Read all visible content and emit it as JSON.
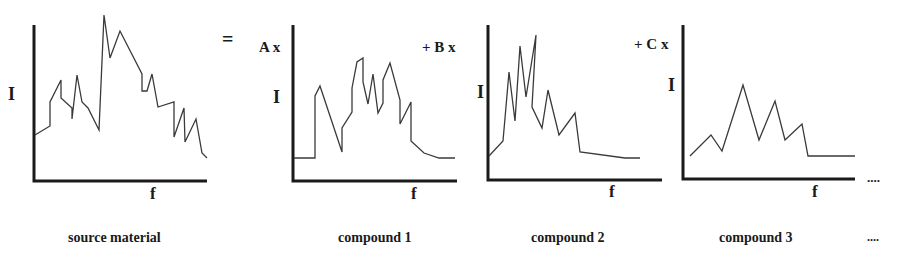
{
  "diagram": {
    "equation": {
      "equals": "=",
      "coef_a": "A x",
      "coef_b": "+ B x",
      "coef_c": "+ C x",
      "ellipsis": "...."
    },
    "panels": [
      {
        "id": "source",
        "caption": "source material",
        "y_label": "I",
        "x_label": "f",
        "points": "35,135 50,126 50,102 61,80 61,98 72,108 72,119 77,75 82,102 88,108 99,130 104,15 110,58 120,31 142,74 142,91 147,91 152,74 158,107 174,102 174,137 184,108 185,142 196,119 202,153 207,158"
      },
      {
        "id": "compound1",
        "caption": "compound 1",
        "y_label": "I",
        "x_label": "f",
        "points": "294,158 315,158 315,96 320,86 342,152 342,128 352,112 352,88 357,62 363,58 363,82 368,104 373,74 378,113 383,103 383,80 390,63 400,100 400,124 411,102 411,141 424,153 439,158 455,158"
      },
      {
        "id": "compound2",
        "caption": "compound 2",
        "y_label": "I",
        "x_label": "f",
        "points": "489,156 503,141 509,72 515,121 520,46 526,97 536,35 532,107 542,128 548,90 559,135 575,113 580,152 625,158 640,158"
      },
      {
        "id": "compound3",
        "caption": "compound 3",
        "y_label": "I",
        "x_label": "f",
        "points": "690,156 711,135 722,151 743,85 759,140 775,101 785,140 802,124 808,156 855,156"
      }
    ],
    "trailing_caption": "...."
  }
}
